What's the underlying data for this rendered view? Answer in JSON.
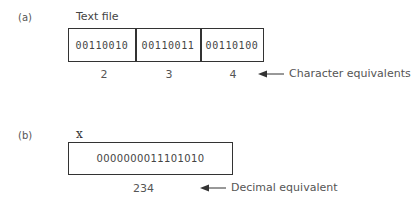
{
  "panel_a": {
    "label": "(a)",
    "title": "Text file",
    "cells": [
      {
        "bits": "00110010",
        "char": "2"
      },
      {
        "bits": "00110011",
        "char": "3"
      },
      {
        "bits": "00110100",
        "char": "4"
      }
    ],
    "annotation": "Character equivalents"
  },
  "panel_b": {
    "label": "(b)",
    "title": "x",
    "bits": "0000000011101010",
    "value": "234",
    "annotation": "Decimal equivalent"
  }
}
